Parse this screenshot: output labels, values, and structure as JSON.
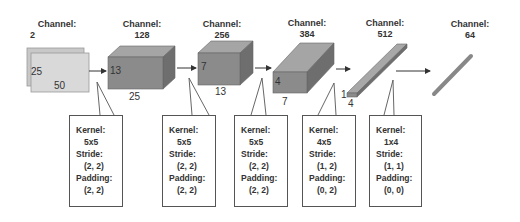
{
  "layers": [
    {
      "channel_label": "Channel:",
      "channel": "2",
      "dims": [
        "25",
        "50"
      ]
    },
    {
      "channel_label": "Channel:",
      "channel": "128",
      "dims": [
        "13",
        "25"
      ]
    },
    {
      "channel_label": "Channel:",
      "channel": "256",
      "dims": [
        "7",
        "13"
      ]
    },
    {
      "channel_label": "Channel:",
      "channel": "384",
      "dims": [
        "4",
        "7"
      ]
    },
    {
      "channel_label": "Channel:",
      "channel": "512",
      "dims": [
        "1",
        "4"
      ]
    },
    {
      "channel_label": "Channel:",
      "channel": "64",
      "dims": []
    }
  ],
  "convs": [
    {
      "kernel_label": "Kernel:",
      "kernel": "5x5",
      "stride_label": "Stride:",
      "stride": "(2, 2)",
      "padding_label": "Padding:",
      "padding": "(2, 2)"
    },
    {
      "kernel_label": "Kernel:",
      "kernel": "5x5",
      "stride_label": "Stride:",
      "stride": "(2, 2)",
      "padding_label": "Padding:",
      "padding": "(2, 2)"
    },
    {
      "kernel_label": "Kernel:",
      "kernel": "5x5",
      "stride_label": "Stride:",
      "stride": "(2, 2)",
      "padding_label": "Padding:",
      "padding": "(2, 2)"
    },
    {
      "kernel_label": "Kernel:",
      "kernel": "4x5",
      "stride_label": "Stride:",
      "stride": "(1, 2)",
      "padding_label": "Padding:",
      "padding": "(0, 2)"
    },
    {
      "kernel_label": "Kernel:",
      "kernel": "1x4",
      "stride_label": "Stride:",
      "stride": "(1, 1)",
      "padding_label": "Padding:",
      "padding": "(0, 0)"
    }
  ],
  "colors": {
    "input_fill": "#d6d6d6",
    "block_front": "#8a8a8a",
    "block_top": "#a8a8a8",
    "block_side": "#6f6f6f",
    "line": "#444444"
  }
}
